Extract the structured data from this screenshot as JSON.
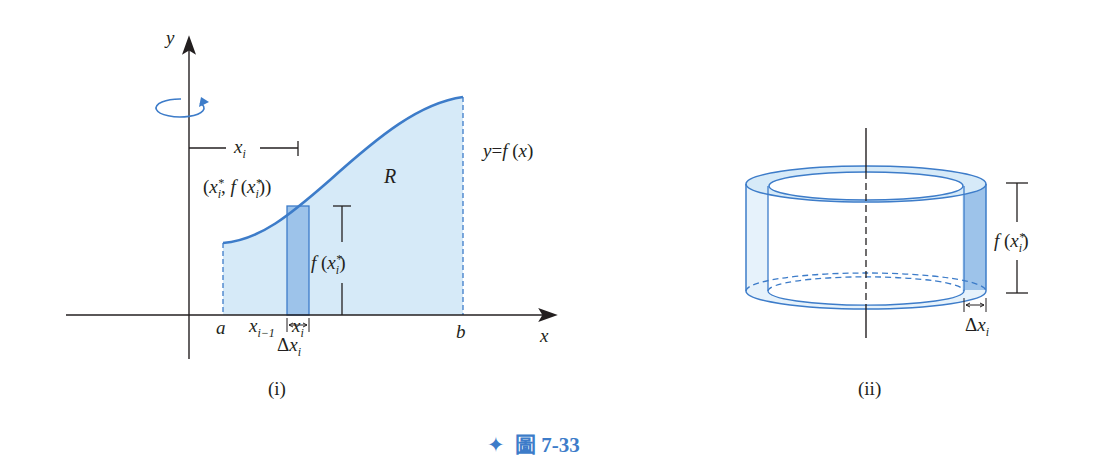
{
  "figure": {
    "label": "圖 7-33",
    "star": "✦",
    "accent_color": "#3d7cc9",
    "fill_color": "#d6eaf8",
    "strip_color": "#9dc3ea"
  },
  "panel_i": {
    "caption": "(i)",
    "axis_x": "x",
    "axis_y": "y",
    "curve_label": "y=f(x)",
    "region_label": "R",
    "point_label": "(x_i*, f(x_i*))",
    "dist_label": "x_i",
    "height_label": "f(x_i*)",
    "ticks": [
      "a",
      "x_{i-1}",
      "x_i",
      "b"
    ],
    "width_label": "Δx_i"
  },
  "panel_ii": {
    "caption": "(ii)",
    "height_label": "f(x_i*)",
    "width_label": "Δx_i"
  }
}
